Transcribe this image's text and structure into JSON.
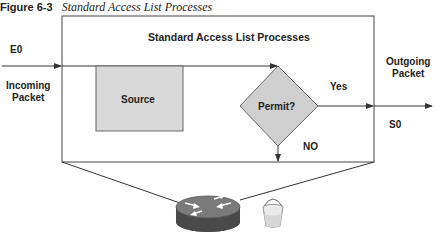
{
  "figure": {
    "number": "Figure 6-3",
    "title": "Standard Access List Processes"
  },
  "diagram": {
    "box_title": "Standard Access List Processes",
    "input_interface": "E0",
    "input_label_line1": "Incoming",
    "input_label_line2": "Packet",
    "source_box": "Source",
    "decision": "Permit?",
    "yes_label": "Yes",
    "no_label": "NO",
    "output_label_line1": "Outgoing",
    "output_label_line2": "Packet",
    "output_interface": "S0",
    "icons": [
      "router-icon",
      "bit-bucket-icon"
    ]
  },
  "colors": {
    "line": "#333333",
    "source_fill": "#d9d9d9",
    "diamond_fill": "#cfcfcf",
    "router_body": "#555555",
    "router_top": "#777777"
  }
}
